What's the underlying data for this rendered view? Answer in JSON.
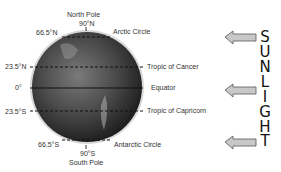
{
  "diagram": {
    "poles": {
      "north": {
        "name": "North Pole",
        "degrees": "90°N"
      },
      "south": {
        "name": "South Pole",
        "degrees": "90°S"
      }
    },
    "latitudes_left": [
      {
        "id": "arctic",
        "degrees": "66.5°N"
      },
      {
        "id": "cancer",
        "degrees": "23.5°N"
      },
      {
        "id": "equator",
        "degrees": "0°"
      },
      {
        "id": "capricorn",
        "degrees": "23.5°S"
      },
      {
        "id": "antarctic",
        "degrees": "66.5°S"
      }
    ],
    "latitudes_right": [
      {
        "id": "arctic",
        "name": "Arctic Circle"
      },
      {
        "id": "cancer",
        "name": "Tropic of Cancer"
      },
      {
        "id": "equator",
        "name": "Equator"
      },
      {
        "id": "capricorn",
        "name": "Tropic of Capricorn"
      },
      {
        "id": "antarctic",
        "name": "Antarctic Circle"
      }
    ],
    "sunlight": {
      "word": "SUNLIGHT",
      "letters": [
        "S",
        "U",
        "N",
        "L",
        "I",
        "G",
        "H",
        "T"
      ],
      "arrow_count": 3,
      "arrow_direction": "left"
    },
    "colors": {
      "globe_dark": "#2a2a2a",
      "globe_light": "#8a8a8a",
      "arrow_fill": "#c8c8c8",
      "arrow_stroke": "#555555",
      "line": "#111111"
    }
  }
}
